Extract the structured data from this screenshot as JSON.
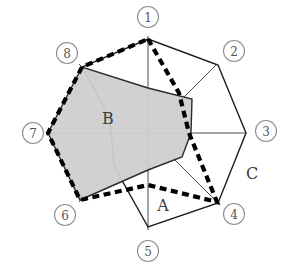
{
  "chart_data": {
    "type": "radar",
    "title": "",
    "subtitle": "",
    "xlabel": "",
    "ylabel": "",
    "grid": false,
    "legend_position": "inline-annotations",
    "axis_count": 8,
    "axis_order_clockwise_from_top": true,
    "rmax": 100,
    "rmin": 0,
    "categories": [
      "1",
      "2",
      "3",
      "4",
      "5",
      "6",
      "7",
      "8"
    ],
    "tick_labels": [
      "①",
      "②",
      "③",
      "④",
      "⑤",
      "⑥",
      "⑦",
      "⑧"
    ],
    "series": [
      {
        "name": "A",
        "style": "thick-dashed",
        "color": "#000000",
        "fill": "none",
        "values": [
          96,
          45,
          42,
          98,
          52,
          69,
          92,
          96
        ]
      },
      {
        "name": "B",
        "style": "solid-filled",
        "color": "#2b2b2b",
        "fill": "#cfcfcf",
        "values": [
          46,
          63,
          44,
          35,
          38,
          69,
          92,
          96
        ]
      },
      {
        "name": "C",
        "style": "thin-solid",
        "color": "#1a1a1a",
        "fill": "none",
        "values": [
          96,
          96,
          97,
          98,
          94,
          49,
          39,
          96
        ]
      }
    ],
    "annotations": [
      {
        "label": "A",
        "x_px": 163,
        "y_px": 205
      },
      {
        "label": "B",
        "x_px": 108,
        "y_px": 118
      },
      {
        "label": "C",
        "x_px": 252,
        "y_px": 173
      }
    ],
    "geometry": {
      "center_px": [
        148,
        133
      ],
      "radius_px": 97,
      "axis_endpoints_px": [
        [
          148,
          36
        ],
        [
          217,
          64
        ],
        [
          245,
          133
        ],
        [
          217,
          202
        ],
        [
          148,
          230
        ],
        [
          79,
          202
        ],
        [
          51,
          133
        ],
        [
          79,
          64
        ]
      ],
      "tick_label_px": [
        [
          148,
          17
        ],
        [
          234,
          51
        ],
        [
          266,
          131
        ],
        [
          234,
          214
        ],
        [
          148,
          251
        ],
        [
          65,
          215
        ],
        [
          33,
          133
        ],
        [
          67,
          53
        ]
      ],
      "series_px": {
        "A": [
          [
            148,
            39
          ],
          [
            179,
            93
          ],
          [
            189,
            133
          ],
          [
            217,
            202
          ],
          [
            148,
            185
          ],
          [
            80,
            200
          ],
          [
            48,
            133
          ],
          [
            82,
            67
          ]
        ],
        "B": [
          [
            148,
            88
          ],
          [
            192,
            99
          ],
          [
            191,
            133
          ],
          [
            182,
            157
          ],
          [
            148,
            170
          ],
          [
            80,
            200
          ],
          [
            48,
            133
          ],
          [
            82,
            67
          ]
        ],
        "C": [
          [
            148,
            39
          ],
          [
            218,
            65
          ],
          [
            246,
            133
          ],
          [
            218,
            203
          ],
          [
            148,
            227
          ],
          [
            114,
            166
          ],
          [
            110,
            118
          ],
          [
            82,
            67
          ]
        ]
      }
    }
  },
  "figure": {
    "background": "#ffffff",
    "axis_color": "#4a4a4a",
    "tick_circle_stroke": "#8d8d8d",
    "tick_text_color": "#555555",
    "annotation_text_color": "#3a3a3a"
  }
}
